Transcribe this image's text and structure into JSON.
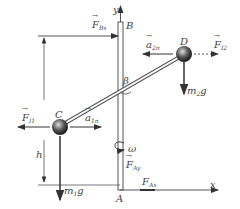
{
  "labels": {
    "y_axis": "y",
    "x_axis": "x",
    "point_B": "B",
    "point_A": "A",
    "point_C": "C",
    "point_D": "D",
    "F_Bx": {
      "main": "F",
      "sub": "Bx"
    },
    "a_2n": {
      "main": "a",
      "sub": "2n"
    },
    "F_i2": {
      "main": "F",
      "sub": "I2"
    },
    "m2g": {
      "main": "m",
      "sub": "2",
      "tail": "g"
    },
    "beta": "β",
    "omega": "ω",
    "h": "h",
    "F_i1": {
      "main": "F",
      "sub": "I1"
    },
    "a_1n": {
      "main": "a",
      "sub": "1n"
    },
    "m1g": {
      "main": "m",
      "sub": "1",
      "tail": "g"
    },
    "F_Ay": {
      "main": "F",
      "sub": "Ay"
    },
    "F_Ax": {
      "main": "F",
      "sub": "Ax"
    }
  },
  "colors": {
    "line": "#555555",
    "ball": "#333333",
    "text": "#444444"
  }
}
